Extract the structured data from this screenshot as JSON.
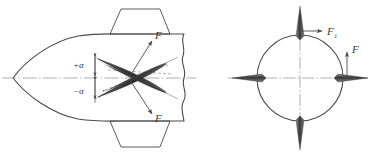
{
  "figure": {
    "background_color": "#ffffff",
    "line_color": "#4a4a4a",
    "centerline_color": "#9a9a9a",
    "label_color": "#3a3a3a"
  },
  "left_view": {
    "name": "side-view-of-missile",
    "description": "Pointed ogive nose body shown in profile with trapezoidal dorsal and ventral fins, crossed control blades, and a wavy break line at the aft end",
    "labels": {
      "angle_positive": "+α",
      "angle_negative": "−α",
      "force_upper": "F",
      "force_lower": "F"
    }
  },
  "right_view": {
    "name": "cross-section-view",
    "description": "Circular body cross-section with four thin cruciform blades at top, bottom, left and right",
    "labels": {
      "force_horizontal": "F",
      "force_horizontal_subscript": "1",
      "force_vertical": "F"
    }
  },
  "caption": {
    "text": ""
  }
}
